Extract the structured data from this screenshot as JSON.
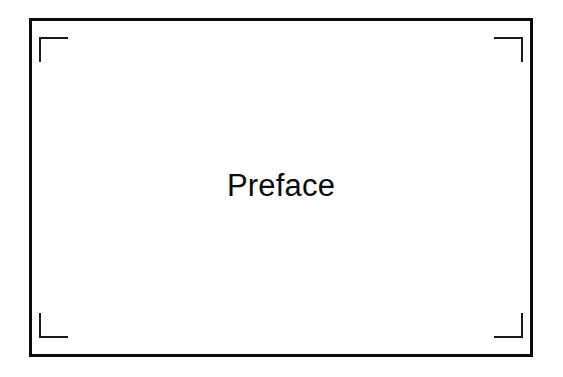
{
  "slide": {
    "title": "Preface",
    "background_color": "#ffffff",
    "frame_color": "#0a0a0a",
    "bracket_color": "#1a1a1a",
    "text_color": "#0a0a0a"
  },
  "decoration": {
    "corners": [
      {
        "name": "top-left",
        "label": ""
      },
      {
        "name": "top-right",
        "label": ""
      },
      {
        "name": "bottom-left",
        "label": ""
      },
      {
        "name": "bottom-right",
        "label": ""
      }
    ]
  }
}
